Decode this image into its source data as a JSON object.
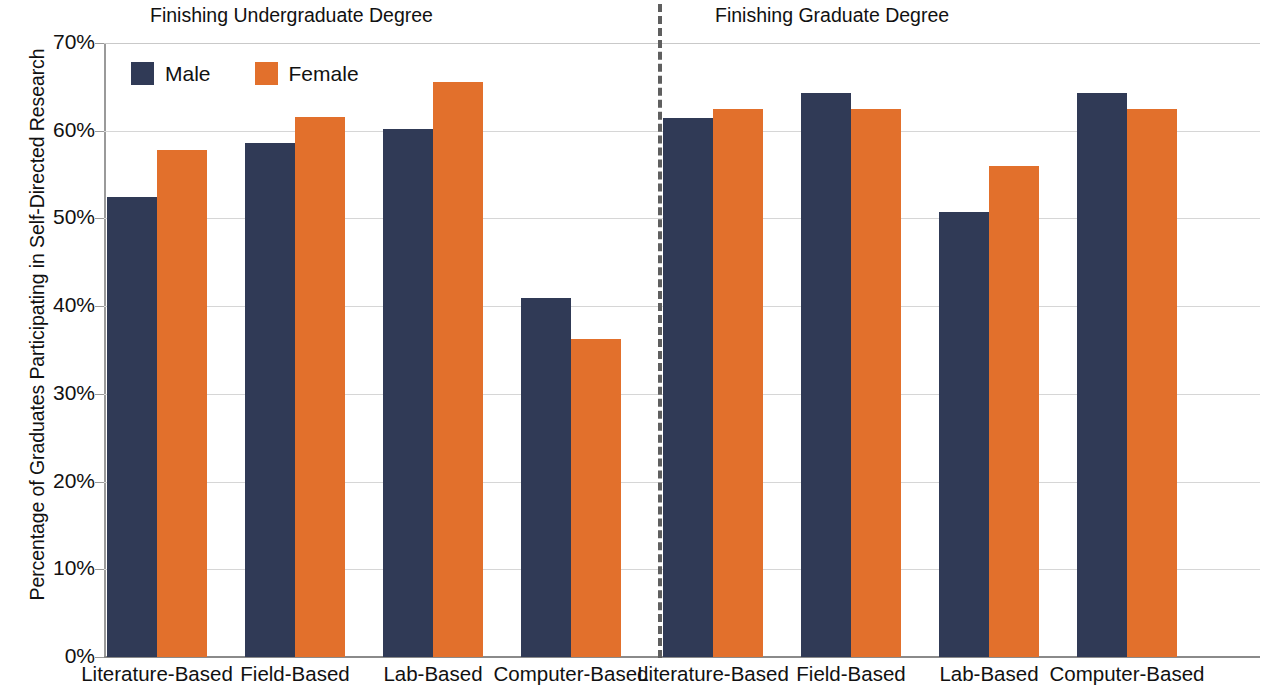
{
  "chart_data": {
    "type": "bar",
    "title": "",
    "xlabel": "",
    "ylabel": "Percentage of Graduates Participating in Self-Directed Research",
    "ylim": [
      0,
      70
    ],
    "y_tick_labels": [
      "70%",
      "60%",
      "50%",
      "40%",
      "30%",
      "20%",
      "10%",
      "0%"
    ],
    "y_tick_values": [
      70,
      60,
      50,
      40,
      30,
      20,
      10,
      0
    ],
    "grid": true,
    "legend_position": "top-left",
    "panels": [
      {
        "title": "Finishing Undergraduate Degree",
        "categories": [
          "Literature-Based",
          "Field-Based",
          "Lab-Based",
          "Computer-Based"
        ],
        "series": [
          {
            "name": "Male",
            "values": [
              52.5,
              58.6,
              60.2,
              40.9
            ]
          },
          {
            "name": "Female",
            "values": [
              57.8,
              61.6,
              65.5,
              36.3
            ]
          }
        ]
      },
      {
        "title": "Finishing Graduate Degree",
        "categories": [
          "Literature-Based",
          "Field-Based",
          "Lab-Based",
          "Computer-Based"
        ],
        "series": [
          {
            "name": "Male",
            "values": [
              61.5,
              64.3,
              50.7,
              64.3
            ]
          },
          {
            "name": "Female",
            "values": [
              62.5,
              62.5,
              56.0,
              62.5
            ]
          }
        ]
      }
    ],
    "colors": {
      "male": "#303A56",
      "female": "#E2702C",
      "gridline": "#D6D6D6",
      "axis": "#8A8A8A",
      "divider": "#5F5F5F",
      "text": "#111111"
    }
  },
  "legend": {
    "entries": [
      {
        "label": "Male",
        "color": "#303A56"
      },
      {
        "label": "Female",
        "color": "#E2702C"
      }
    ]
  }
}
